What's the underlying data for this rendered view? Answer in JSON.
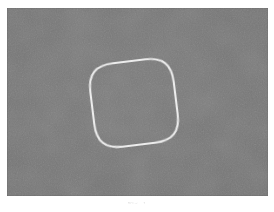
{
  "page": {
    "background_color": "#ffffff",
    "width": 274,
    "height": 212
  },
  "figure": {
    "name": "scanned-figure-plate",
    "background_color": "#757575",
    "plate": {
      "x": 7,
      "y": 8,
      "width": 261,
      "height": 188
    },
    "shape": {
      "name": "rounded-square-outline",
      "kind": "closed-curve",
      "stroke_color": "#ececec",
      "stroke_width": 2.1,
      "fill": "none",
      "rotation_degrees": -7,
      "center": {
        "x": 134,
        "y": 103
      },
      "bounds": {
        "left": 94,
        "top": 56,
        "right": 174,
        "bottom": 151
      },
      "corner_radius": 26,
      "side_length": 84
    }
  },
  "caption": {
    "text": "Fig. 1",
    "color": "#b9b9b9",
    "truncated": true
  }
}
